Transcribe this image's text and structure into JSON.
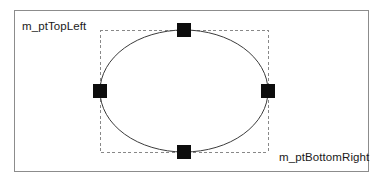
{
  "figure": {
    "type": "diagram",
    "background_color": "#ffffff",
    "frame": {
      "border_color": "#8c8c8c",
      "fill_color": "#ffffff",
      "x": 14,
      "y": 10,
      "width": 355,
      "height": 162
    },
    "bounding_rect": {
      "stroke_color": "#888888",
      "stroke_style": "dashed",
      "fill": "none",
      "x": 100,
      "y": 30,
      "width": 168,
      "height": 122
    },
    "ellipse": {
      "stroke_color": "#3c3c3c",
      "fill": "none",
      "cx": 184,
      "cy": 91,
      "rx": 84,
      "ry": 61
    },
    "handles": [
      {
        "name": "top-handle",
        "cx": 184,
        "cy": 30,
        "size": 14,
        "color": "#0d0d0d"
      },
      {
        "name": "left-handle",
        "cx": 100,
        "cy": 91,
        "size": 14,
        "color": "#0d0d0d"
      },
      {
        "name": "right-handle",
        "cx": 268,
        "cy": 91,
        "size": 14,
        "color": "#0d0d0d"
      },
      {
        "name": "bottom-handle",
        "cx": 184,
        "cy": 152,
        "size": 14,
        "color": "#0d0d0d"
      }
    ]
  },
  "labels": {
    "top_left": "m_ptTopLeft",
    "bottom_right": "m_ptBottomRight"
  }
}
